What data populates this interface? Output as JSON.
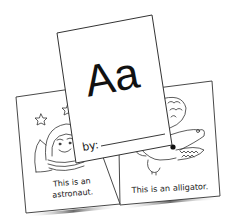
{
  "illustration": {
    "subject": "alphabet mini-book pages",
    "cover": {
      "letters": "Aa",
      "author_label": "by:"
    },
    "left_page": {
      "line1": "This is an",
      "line2": "astronaut.",
      "picture": "astronaut-with-stars"
    },
    "right_page": {
      "line1": "This is an alligator.",
      "picture": "alligator"
    }
  },
  "colors": {
    "paper": "#ffffff",
    "ink": "#222222",
    "shadow": "#555555"
  }
}
